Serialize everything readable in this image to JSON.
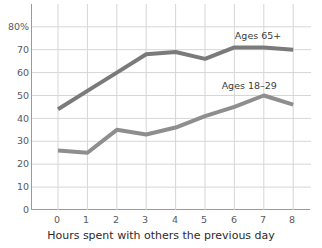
{
  "chart_data": {
    "type": "line",
    "title": "",
    "xlabel": "Hours spent with others the previous day",
    "ylabel": "",
    "x": [
      0,
      1,
      2,
      3,
      4,
      5,
      6,
      7,
      8
    ],
    "xticklabels": [
      "0",
      "1",
      "2",
      "3",
      "4",
      "5",
      "6",
      "7",
      "8"
    ],
    "yticks": [
      0,
      10,
      20,
      30,
      40,
      50,
      60,
      70,
      80
    ],
    "yticklabels": [
      "0",
      "10",
      "20",
      "30",
      "40",
      "50",
      "60",
      "70",
      "80%"
    ],
    "ylim": [
      0,
      85
    ],
    "xlim": [
      -0.5,
      8.8
    ],
    "grid": true,
    "legend": "inline-annotations",
    "series": [
      {
        "name": "Ages 65+",
        "color": "#7a7a7a",
        "values": [
          44,
          52,
          60,
          68,
          69,
          66,
          71,
          71,
          70
        ],
        "label_x": 6.05,
        "label_y": 76
      },
      {
        "name": "Ages 18–29",
        "color": "#8e8e8e",
        "values": [
          26,
          25,
          35,
          33,
          36,
          41,
          45,
          50,
          46
        ],
        "label_x": 5.6,
        "label_y": 54
      }
    ]
  },
  "axis": {
    "ytick_0": "0",
    "ytick_10": "10",
    "ytick_20": "20",
    "ytick_30": "30",
    "ytick_40": "40",
    "ytick_50": "50",
    "ytick_60": "60",
    "ytick_70": "70",
    "ytick_80": "80%",
    "xtick_0": "0",
    "xtick_1": "1",
    "xtick_2": "2",
    "xtick_3": "3",
    "xtick_4": "4",
    "xtick_5": "5",
    "xtick_6": "6",
    "xtick_7": "7",
    "xtick_8": "8"
  },
  "labels": {
    "xaxis_title": "Hours spent with others the previous day",
    "series_older": "Ages 65+",
    "series_younger": "Ages 18–29"
  },
  "colors": {
    "line_older": "#7a7a7a",
    "line_younger": "#8e8e8e",
    "grid": "#d6d6d6",
    "axis": "#9a9a9a",
    "tick_text": "#58595b",
    "axis_title_text": "#2b2b2b"
  }
}
